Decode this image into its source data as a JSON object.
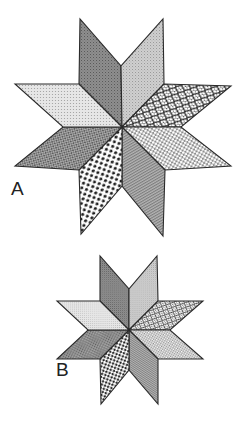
{
  "figure": {
    "width": 245,
    "height": 424,
    "background": "#ffffff",
    "stroke": "#2a2a2a"
  },
  "patterns": {
    "nnw": {
      "name": "dark-stipple",
      "base": "#8e8e8e",
      "ink": "#5a5a5a",
      "kind": "stipple"
    },
    "nne": {
      "name": "light-stipple",
      "base": "#cfcfcf",
      "ink": "#9a9a9a",
      "kind": "stipple"
    },
    "wnw": {
      "name": "light-dot-grid",
      "base": "#e6e6e6",
      "ink": "#9c9c9c",
      "kind": "grid"
    },
    "ene": {
      "name": "rings",
      "base": "#ffffff",
      "ink": "#2b2b2b",
      "kind": "rings"
    },
    "wsw": {
      "name": "crosshatch",
      "base": "#a8a8a8",
      "ink": "#5e5e5e",
      "kind": "crosshatch"
    },
    "ese": {
      "name": "honeycomb",
      "base": "#8f8f8f",
      "ink": "#ffffff",
      "kind": "honeycomb"
    },
    "ssw": {
      "name": "black-dots",
      "base": "#ffffff",
      "ink": "#1e1e1e",
      "kind": "dots"
    },
    "sse": {
      "name": "fine-diagonal",
      "base": "#b4b4b4",
      "ink": "#7c7c7c",
      "kind": "diagonal"
    }
  },
  "stars": [
    {
      "id": "A",
      "label": "A",
      "label_pos": [
        11,
        179
      ],
      "scale": 1.0,
      "center": [
        122,
        127
      ],
      "diamonds": [
        {
          "slot": "nnw",
          "points": [
            [
              122,
              127
            ],
            [
              79,
              84
            ],
            [
              80,
              19
            ],
            [
              121,
              66
            ]
          ]
        },
        {
          "slot": "nne",
          "points": [
            [
              122,
              127
            ],
            [
              121,
              66
            ],
            [
              163,
              19
            ],
            [
              164,
              84
            ]
          ]
        },
        {
          "slot": "ene",
          "points": [
            [
              122,
              127
            ],
            [
              164,
              84
            ],
            [
              231,
              86
            ],
            [
              181,
              127
            ]
          ]
        },
        {
          "slot": "ese",
          "points": [
            [
              122,
              127
            ],
            [
              181,
              127
            ],
            [
              231,
              166
            ],
            [
              165,
              170
            ]
          ]
        },
        {
          "slot": "sse",
          "points": [
            [
              122,
              127
            ],
            [
              165,
              170
            ],
            [
              163,
              236
            ],
            [
              122,
              186
            ]
          ]
        },
        {
          "slot": "ssw",
          "points": [
            [
              122,
              127
            ],
            [
              122,
              186
            ],
            [
              81,
              234
            ],
            [
              79,
              170
            ]
          ]
        },
        {
          "slot": "wsw",
          "points": [
            [
              122,
              127
            ],
            [
              79,
              170
            ],
            [
              15,
              166
            ],
            [
              63,
              127
            ]
          ]
        },
        {
          "slot": "wnw",
          "points": [
            [
              122,
              127
            ],
            [
              63,
              127
            ],
            [
              15,
              84
            ],
            [
              79,
              84
            ]
          ]
        }
      ]
    },
    {
      "id": "B",
      "label": "B",
      "label_pos": [
        56,
        360
      ],
      "scale": 0.68,
      "center": [
        129,
        330
      ],
      "diamonds": [
        {
          "slot": "nnw",
          "points": [
            [
              129,
              330
            ],
            [
              100,
              301
            ],
            [
              100,
              256
            ],
            [
              129,
              289
            ]
          ]
        },
        {
          "slot": "nne",
          "points": [
            [
              129,
              330
            ],
            [
              129,
              289
            ],
            [
              157,
              256
            ],
            [
              158,
              301
            ]
          ]
        },
        {
          "slot": "ene",
          "points": [
            [
              129,
              330
            ],
            [
              158,
              301
            ],
            [
              203,
              301
            ],
            [
              170,
              330
            ]
          ]
        },
        {
          "slot": "ese",
          "points": [
            [
              129,
              330
            ],
            [
              170,
              330
            ],
            [
              203,
              359
            ],
            [
              158,
              359
            ]
          ]
        },
        {
          "slot": "sse",
          "points": [
            [
              129,
              330
            ],
            [
              158,
              359
            ],
            [
              158,
              404
            ],
            [
              129,
              370
            ]
          ]
        },
        {
          "slot": "ssw",
          "points": [
            [
              129,
              330
            ],
            [
              129,
              370
            ],
            [
              101,
              404
            ],
            [
              100,
              359
            ]
          ]
        },
        {
          "slot": "wsw",
          "points": [
            [
              129,
              330
            ],
            [
              100,
              359
            ],
            [
              57,
              359
            ],
            [
              88,
              330
            ]
          ]
        },
        {
          "slot": "wnw",
          "points": [
            [
              129,
              330
            ],
            [
              88,
              330
            ],
            [
              57,
              301
            ],
            [
              100,
              301
            ]
          ]
        }
      ]
    }
  ]
}
